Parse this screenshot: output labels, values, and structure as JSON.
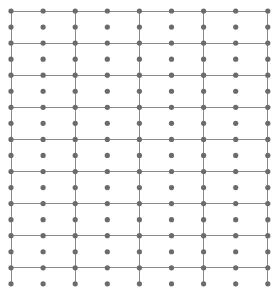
{
  "figure": {
    "type": "diagram",
    "width": 280,
    "height": 293,
    "background_color": "#ffffff"
  },
  "grid_data": {
    "type": "dot-lattice",
    "dot": {
      "count_x": 9,
      "count_y": 18,
      "origin_x": 11,
      "origin_y": 11,
      "spacing_x": 32.1,
      "spacing_y": 16.05,
      "radius": 2.6,
      "color": "#6b6b6b",
      "total": 162
    },
    "lines": {
      "horizontal": {
        "stride_rows": 2,
        "row_indices": [
          0,
          2,
          4,
          6,
          8,
          10,
          12,
          14,
          16
        ],
        "count": 9,
        "color": "#8a8a8a",
        "width": 1,
        "x_start": 11,
        "x_end": 268
      },
      "vertical": {
        "stride_cols": 2,
        "col_indices": [
          0,
          2,
          4,
          6,
          8
        ],
        "count": 5,
        "color": "#8a8a8a",
        "width": 1,
        "y_start": 11,
        "y_end": 284
      }
    },
    "cells": {
      "columns": 4,
      "rows": 8,
      "cell_width": 64.2,
      "cell_height": 32.1
    }
  }
}
